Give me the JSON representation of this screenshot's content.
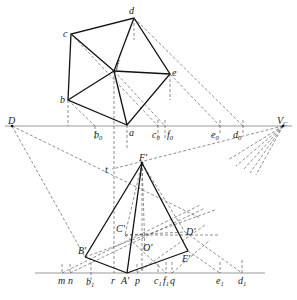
{
  "diagram": {
    "type": "perspective-construction",
    "plan_view": {
      "points": {
        "a": {
          "x": 127,
          "y": 125,
          "label": "a"
        },
        "b": {
          "x": 68,
          "y": 100,
          "label": "b"
        },
        "c": {
          "x": 71,
          "y": 34,
          "label": "c"
        },
        "d": {
          "x": 134,
          "y": 18,
          "label": "d"
        },
        "e": {
          "x": 170,
          "y": 74,
          "label": "e"
        },
        "f": {
          "x": 114,
          "y": 71,
          "label": "f"
        }
      },
      "ground_line_ticks": [
        {
          "label": "b",
          "sub": "0",
          "x": 95
        },
        {
          "label": "c",
          "sub": "0",
          "x": 158
        },
        {
          "label": "f",
          "sub": "0",
          "x": 165
        },
        {
          "label": "e",
          "sub": "0",
          "x": 220
        },
        {
          "label": "d",
          "sub": "0",
          "x": 243
        }
      ]
    },
    "horizon_points": {
      "D": {
        "x": 12,
        "y": 126,
        "label": "D"
      },
      "Vc": {
        "x": 283,
        "y": 126,
        "label": "V",
        "sub": "C"
      }
    },
    "perspective_view": {
      "points": {
        "A": {
          "x": 127,
          "y": 273,
          "label": "A'"
        },
        "B": {
          "x": 85,
          "y": 257,
          "label": "B'"
        },
        "C": {
          "x": 125,
          "y": 235,
          "label": "C'"
        },
        "D": {
          "x": 185,
          "y": 232,
          "label": "D'"
        },
        "E": {
          "x": 188,
          "y": 251,
          "label": "E'"
        },
        "F": {
          "x": 142,
          "y": 163,
          "label": "F'"
        },
        "O": {
          "x": 145,
          "y": 250,
          "label": "O'"
        },
        "t": {
          "x": 112,
          "y": 169,
          "label": "t"
        }
      },
      "ground_line_ticks": [
        {
          "label": "m",
          "sub": "",
          "x": 62
        },
        {
          "label": "n",
          "sub": "",
          "x": 70
        },
        {
          "label": "b",
          "sub": "1",
          "x": 91
        },
        {
          "label": "r",
          "sub": "",
          "x": 113
        },
        {
          "label": "p",
          "sub": "",
          "x": 137
        },
        {
          "label": "c",
          "sub": "1",
          "x": 158
        },
        {
          "label": "f",
          "sub": "1",
          "x": 166
        },
        {
          "label": "q",
          "sub": "",
          "x": 172
        },
        {
          "label": "e",
          "sub": "1",
          "x": 220
        },
        {
          "label": "d",
          "sub": "1",
          "x": 242
        }
      ]
    }
  }
}
